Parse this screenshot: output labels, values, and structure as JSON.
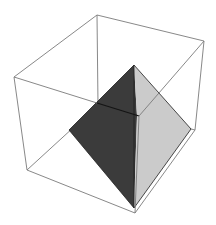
{
  "figure": {
    "type": "3d-wireframe-box-with-pyramid",
    "width": 216,
    "height": 225,
    "background": "#ffffff"
  },
  "colors": {
    "box_edge": "#7a7a7a",
    "pyramid_dark_face": "#3b3b3b",
    "pyramid_light_face": "#cbcbcb",
    "pyramid_edge": "#1e1e1e",
    "hidden_edge_on_dark": "#141414"
  },
  "box": {
    "vertices": {
      "top_left": [
        14,
        77
      ],
      "top_back": [
        97,
        15
      ],
      "top_right": [
        204,
        41
      ],
      "top_front": [
        139,
        116
      ],
      "bottom_left": [
        27,
        170
      ],
      "bottom_back": [
        98,
        105
      ],
      "bottom_right": [
        195,
        130
      ],
      "bottom_front": [
        135,
        213
      ]
    }
  },
  "pyramid": {
    "vertices": {
      "apex": [
        134,
        65
      ],
      "left": [
        69,
        130
      ],
      "right": [
        191,
        129
      ],
      "bottom": [
        134,
        208
      ],
      "front_ridge_top": [
        137,
        116
      ]
    }
  }
}
